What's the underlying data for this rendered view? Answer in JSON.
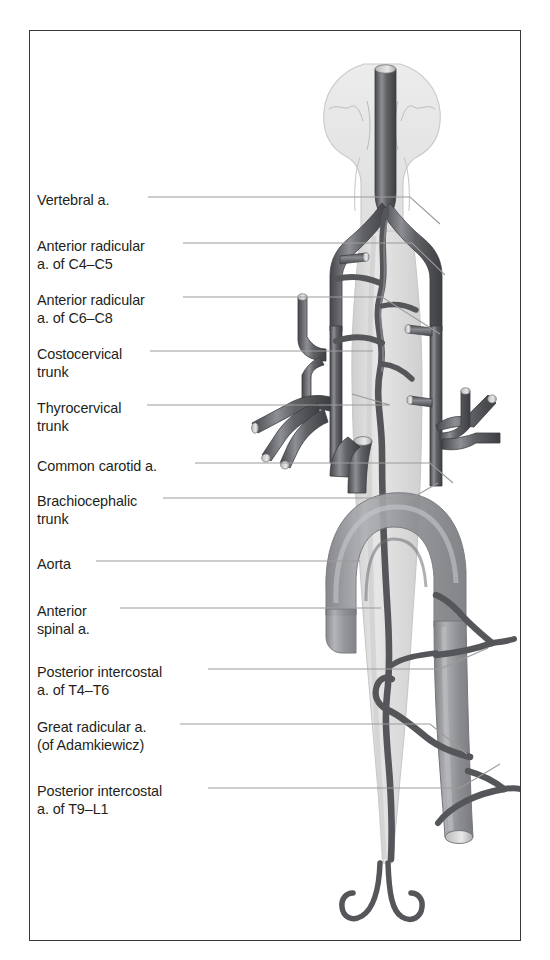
{
  "figure": {
    "frame": {
      "border_color": "#3a3a3a",
      "background": "#ffffff"
    }
  },
  "palette": {
    "artery_dark": "#55565a",
    "artery_dark_edge": "#3b3c40",
    "artery_highlight": "#9a9ba0",
    "aorta_mid": "#8e9094",
    "aorta_light": "#a9abaf",
    "cord_light": "#dcdcdc",
    "cord_edge": "#c2c2c2",
    "brain_fill": "#e4e4e4",
    "leader_line": "#9b9b9b",
    "text": "#231f20"
  },
  "labels": [
    {
      "id": "vertebral-a",
      "lines": [
        "Vertebral a."
      ],
      "x": 7,
      "y": 161
    },
    {
      "id": "anterior-radicular-c4c5",
      "lines": [
        "Anterior radicular",
        "a. of C4–C5"
      ],
      "x": 7,
      "y": 207
    },
    {
      "id": "anterior-radicular-c6c8",
      "lines": [
        "Anterior radicular",
        "a. of C6–C8"
      ],
      "x": 7,
      "y": 261
    },
    {
      "id": "costocervical-trunk",
      "lines": [
        "Costocervical",
        "trunk"
      ],
      "x": 7,
      "y": 315
    },
    {
      "id": "thyrocervical-trunk",
      "lines": [
        "Thyrocervical",
        "trunk"
      ],
      "x": 7,
      "y": 369
    },
    {
      "id": "common-carotid-a",
      "lines": [
        "Common carotid a."
      ],
      "x": 7,
      "y": 427
    },
    {
      "id": "brachiocephalic-trunk",
      "lines": [
        "Brachiocephalic",
        "trunk"
      ],
      "x": 7,
      "y": 462
    },
    {
      "id": "aorta",
      "lines": [
        "Aorta"
      ],
      "x": 7,
      "y": 525
    },
    {
      "id": "anterior-spinal-a",
      "lines": [
        "Anterior",
        "spinal a."
      ],
      "x": 7,
      "y": 572
    },
    {
      "id": "posterior-intercostal-t4t6",
      "lines": [
        "Posterior intercostal",
        "a. of T4–T6"
      ],
      "x": 7,
      "y": 633
    },
    {
      "id": "great-radicular-a",
      "lines": [
        "Great radicular a.",
        "(of Adamkiewicz)"
      ],
      "x": 7,
      "y": 688
    },
    {
      "id": "posterior-intercostal-t9l1",
      "lines": [
        "Posterior intercostal",
        "a. of T9–L1"
      ],
      "x": 7,
      "y": 752
    }
  ],
  "leaders": [
    {
      "id": "leader-vertebral-a",
      "d": "M 118 166 L 380 166 L 410 193"
    },
    {
      "id": "leader-anterior-radicular-c4c5",
      "d": "M 153 212 L 382 212 L 415 244"
    },
    {
      "id": "leader-anterior-radicular-c6c8",
      "d": "M 153 266 L 352 266 L 410 303"
    },
    {
      "id": "leader-costocervical-trunk",
      "d": "M 120 320 L 343 320"
    },
    {
      "id": "leader-thyrocervical-trunk",
      "d": "M 117 374 L 360 374 L 322 363"
    },
    {
      "id": "leader-common-carotid-a",
      "d": "M 165 432 L 400 432 L 423 452"
    },
    {
      "id": "leader-brachiocephalic-trunk",
      "d": "M 133 467 L 382 467 L 408 452"
    },
    {
      "id": "leader-aorta",
      "d": "M 66 530 L 330 530"
    },
    {
      "id": "leader-anterior-spinal-a",
      "d": "M 90 577 L 351 577"
    },
    {
      "id": "leader-posterior-intercostal-t4t6",
      "d": "M 178 638 L 410 638 L 458 617"
    },
    {
      "id": "leader-great-radicular-a",
      "d": "M 150 693 L 400 693 L 437 723"
    },
    {
      "id": "leader-posterior-intercostal-t9l1",
      "d": "M 178 757 L 430 757 L 470 733"
    }
  ]
}
